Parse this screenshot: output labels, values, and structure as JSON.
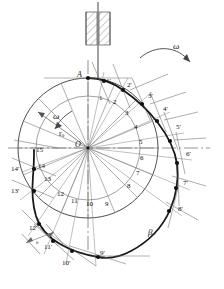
{
  "figure": {
    "type": "cam-profile-construction",
    "center_label": "O",
    "start_point_label": "A",
    "base_radius_label": "r",
    "base_radius_sub": "0",
    "profile_angle_label": "β",
    "omega_label": "ω",
    "omega_inner_label": "ω",
    "stroke_dim_label": "h"
  },
  "geometry": {
    "center": {
      "x": 88,
      "y": 148
    },
    "base_circle_radius": 70,
    "inner_arc_radius": 52,
    "divisions": 16,
    "start_angle_deg": -90,
    "direction": "clockwise"
  },
  "inner_labels": [
    {
      "text": "1",
      "x": 99,
      "y": 95
    },
    {
      "text": "2",
      "x": 113,
      "y": 99
    },
    {
      "text": "3",
      "x": 125,
      "y": 110
    },
    {
      "text": "4",
      "x": 134,
      "y": 124
    },
    {
      "text": "5",
      "x": 139,
      "y": 139
    },
    {
      "text": "6",
      "x": 140,
      "y": 155
    },
    {
      "text": "7",
      "x": 136,
      "y": 170
    },
    {
      "text": "8",
      "x": 127,
      "y": 183
    },
    {
      "text": "9",
      "x": 105,
      "y": 201
    },
    {
      "text": "10",
      "x": 88,
      "y": 201
    },
    {
      "text": "11",
      "x": 73,
      "y": 198
    },
    {
      "text": "12",
      "x": 59,
      "y": 191
    },
    {
      "text": "13",
      "x": 44,
      "y": 176
    },
    {
      "text": "14",
      "x": 38,
      "y": 163
    },
    {
      "text": "15",
      "x": 36,
      "y": 148
    }
  ],
  "outer_labels": [
    {
      "text": "1'",
      "x": 108,
      "y": 80
    },
    {
      "text": "2'",
      "x": 128,
      "y": 84
    },
    {
      "text": "3'",
      "x": 149,
      "y": 95
    },
    {
      "text": "4'",
      "x": 164,
      "y": 107
    },
    {
      "text": "5'",
      "x": 177,
      "y": 125
    },
    {
      "text": "6'",
      "x": 188,
      "y": 152
    },
    {
      "text": "7'",
      "x": 185,
      "y": 180
    },
    {
      "text": "8'",
      "x": 180,
      "y": 208
    },
    {
      "text": "9'",
      "x": 101,
      "y": 254
    },
    {
      "text": "10'",
      "x": 64,
      "y": 263
    },
    {
      "text": "11'",
      "x": 45,
      "y": 247
    },
    {
      "text": "12'",
      "x": 31,
      "y": 228
    },
    {
      "text": "13'",
      "x": 13,
      "y": 190
    },
    {
      "text": "14'",
      "x": 13,
      "y": 168
    },
    {
      "text": "15",
      "x": 36,
      "y": 148
    }
  ],
  "profile_points": [
    {
      "n": "1'",
      "x": 101,
      "y": 89
    },
    {
      "n": "2'",
      "x": 121,
      "y": 92
    },
    {
      "n": "3'",
      "x": 141,
      "y": 103
    },
    {
      "n": "4'",
      "x": 157,
      "y": 118
    },
    {
      "n": "5'",
      "x": 169,
      "y": 137
    },
    {
      "n": "6'",
      "x": 177,
      "y": 158
    },
    {
      "n": "7'",
      "x": 176,
      "y": 183
    },
    {
      "n": "8'",
      "x": 171,
      "y": 207
    },
    {
      "n": "9'",
      "x": 98,
      "y": 256
    },
    {
      "n": "10'",
      "x": 72,
      "y": 252
    },
    {
      "n": "11'",
      "x": 53,
      "y": 242
    },
    {
      "n": "12'",
      "x": 40,
      "y": 225
    },
    {
      "n": "13'",
      "x": 34,
      "y": 192
    },
    {
      "n": "14'",
      "x": 34,
      "y": 170
    },
    {
      "n": "A",
      "x": 88,
      "y": 78
    }
  ],
  "annotations": {
    "omega_outer": {
      "x": 176,
      "y": 47
    },
    "omega_inner": {
      "x": 56,
      "y": 117
    },
    "r0": {
      "x": 62,
      "y": 134
    },
    "beta": {
      "x": 150,
      "y": 232
    },
    "stroke_h": {
      "x": 38,
      "y": 243
    },
    "A": {
      "x": 78,
      "y": 74
    },
    "O": {
      "x": 75,
      "y": 141
    }
  },
  "colors": {
    "ink": "#1a1a1a",
    "thin": "#4a4a4a",
    "construction": "#6b6b6b",
    "axis": "#555555",
    "hatch": "#777777",
    "background": "#ffffff"
  }
}
